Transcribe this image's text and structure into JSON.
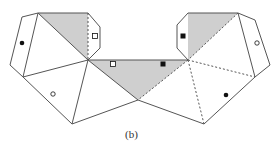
{
  "figure": {
    "caption": "(b)",
    "colors": {
      "stroke": "#555555",
      "shade": "#cfcfcf",
      "marker": "#111111",
      "background": "#ffffff"
    },
    "markers": [
      {
        "shape": "filled-circle",
        "x": 22,
        "y": 43
      },
      {
        "shape": "open-circle",
        "x": 53,
        "y": 94
      },
      {
        "shape": "open-square",
        "x": 95,
        "y": 36
      },
      {
        "shape": "open-square",
        "x": 113,
        "y": 64
      },
      {
        "shape": "filled-square",
        "x": 163,
        "y": 64
      },
      {
        "shape": "filled-square",
        "x": 183,
        "y": 36
      },
      {
        "shape": "open-circle",
        "x": 257,
        "y": 43
      },
      {
        "shape": "filled-circle",
        "x": 226,
        "y": 95
      }
    ]
  }
}
